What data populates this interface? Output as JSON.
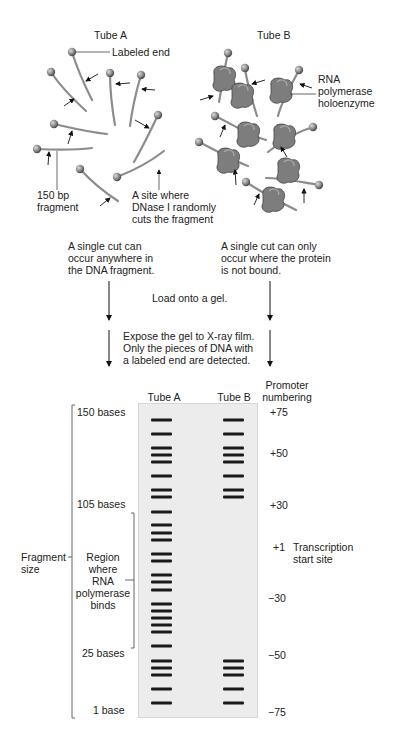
{
  "top": {
    "tube_a_title": "Tube A",
    "tube_b_title": "Tube B",
    "labeled_end": "Labeled end",
    "fragment_150": [
      "150 bp",
      "fragment"
    ],
    "dnase_site": [
      "A site where",
      "DNase I randomly",
      "cuts the fragment"
    ],
    "rna_pol": [
      "RNA",
      "polymerase",
      "holoenzyme"
    ]
  },
  "middle": {
    "tube_a_note": [
      "A single cut can",
      "occur anywhere in",
      "the DNA fragment."
    ],
    "tube_b_note": [
      "A single cut can only",
      "occur where the protein",
      "is not bound."
    ],
    "step1": "Load onto a gel.",
    "step2": [
      "Expose the gel to X-ray film.",
      "Only the pieces of DNA with",
      "a labeled end are detected."
    ]
  },
  "gel": {
    "lane_a_label": "Tube A",
    "lane_b_label": "Tube B",
    "promoter_header": [
      "Promoter",
      "numbering"
    ],
    "size_labels": [
      "150 bases",
      "105 bases",
      "25 bases",
      "1 base"
    ],
    "fragment_size": [
      "Fragment",
      "size"
    ],
    "binding_region": [
      "Region",
      "where",
      "RNA",
      "polymerase",
      "binds"
    ],
    "promoter_numbers": [
      "+75",
      "+50",
      "+30",
      "+1",
      "−30",
      "−50",
      "−75"
    ],
    "transcription_start": [
      "Transcription",
      "start site"
    ],
    "band_color": "#1a1a1a",
    "lane_a_band_count": 28,
    "lane_b_band_count": 13,
    "lane_b_footprint": "bands absent between 105 bases and 25 bases (protein-protected region)"
  }
}
